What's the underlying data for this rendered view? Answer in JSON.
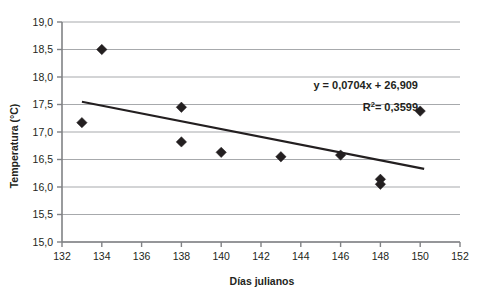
{
  "chart_data": {
    "type": "scatter",
    "title": "",
    "xlabel": "Días julianos",
    "ylabel": "Temperatura (°C)",
    "xlim": [
      132,
      152
    ],
    "ylim": [
      15.0,
      19.0
    ],
    "xticks": [
      132,
      134,
      136,
      138,
      140,
      142,
      144,
      146,
      148,
      150,
      152
    ],
    "xtick_labels": [
      "132",
      "134",
      "136",
      "138",
      "140",
      "142",
      "144",
      "146",
      "148",
      "150",
      "152"
    ],
    "yticks": [
      15.0,
      15.5,
      16.0,
      16.5,
      17.0,
      17.5,
      18.0,
      18.5,
      19.0
    ],
    "ytick_labels": [
      "15,0",
      "15,5",
      "16,0",
      "16,5",
      "17,0",
      "17,5",
      "18,0",
      "18,5",
      "19,0"
    ],
    "grid": "horizontal",
    "legend": "none",
    "marker": "diamond",
    "marker_color": "#231f20",
    "series": [
      {
        "name": "Temperatura",
        "points": [
          {
            "x": 133,
            "y": 17.17
          },
          {
            "x": 134,
            "y": 18.5
          },
          {
            "x": 138,
            "y": 17.45
          },
          {
            "x": 138,
            "y": 16.82
          },
          {
            "x": 140,
            "y": 16.63
          },
          {
            "x": 143,
            "y": 16.55
          },
          {
            "x": 146,
            "y": 16.58
          },
          {
            "x": 148,
            "y": 16.14
          },
          {
            "x": 148,
            "y": 16.05
          },
          {
            "x": 150,
            "y": 17.38
          }
        ]
      }
    ],
    "trendline": {
      "type": "linear",
      "equation": "y = 0,0704x + 26,909",
      "r_squared_label": "R",
      "r_squared_sup": "2",
      "r_squared_value": "= 0,3599",
      "slope": -0.0704,
      "intercept": 26.909,
      "x_start": 133,
      "y_start": 17.55,
      "x_end": 150.2,
      "y_end": 16.33,
      "color": "#231f20"
    },
    "annotations": [
      {
        "name": "trend-equation",
        "text": "y = 0,0704x + 26,909"
      },
      {
        "name": "r-squared",
        "text": "R² = 0,3599"
      }
    ]
  },
  "axes": {
    "axis_color": "#808285",
    "grid_color": "#a7a9ac",
    "text_color": "#231f20"
  }
}
